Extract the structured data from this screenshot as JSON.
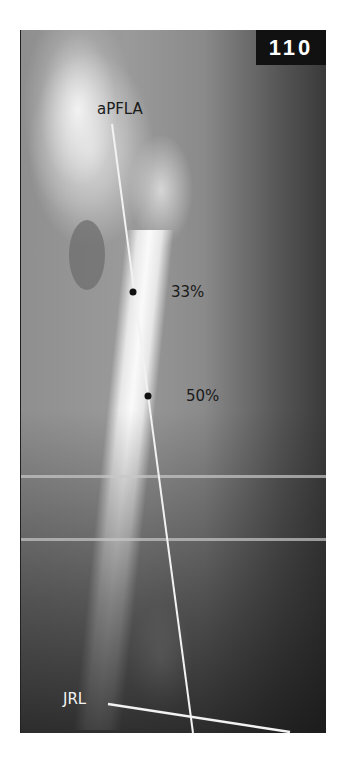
{
  "figure": {
    "badge_number": "110",
    "labels": {
      "axis_line": "aPFLA",
      "point_33": "33%",
      "point_50": "50%",
      "joint_line": "JRL"
    },
    "colors": {
      "badge_bg": "#111111",
      "badge_text": "#ffffff",
      "line_color": "#f2f2f2",
      "dot_color": "#111111",
      "label_dark": "#1a1a1a",
      "label_light": "#f2f2f2"
    }
  }
}
